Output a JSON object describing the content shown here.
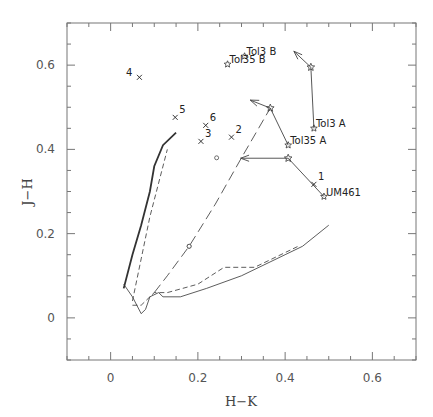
{
  "chart_data": {
    "type": "scatter",
    "title": "",
    "xlabel": "H−K",
    "ylabel": "J−H",
    "xlim": [
      -0.1,
      0.7
    ],
    "ylim": [
      -0.1,
      0.7
    ],
    "grid": false,
    "legend": null,
    "x_ticks": [
      0,
      0.2,
      0.4,
      0.6
    ],
    "x_tick_labels": [
      "0",
      "0.2",
      "0.4",
      "0.6"
    ],
    "y_ticks": [
      0,
      0.2,
      0.4,
      0.6
    ],
    "y_tick_labels": [
      "0",
      "0.2",
      "0.4",
      "0.6"
    ],
    "cross_points": [
      {
        "label": "1",
        "x": 0.466,
        "y": 0.317
      },
      {
        "label": "2",
        "x": 0.277,
        "y": 0.429
      },
      {
        "label": "3",
        "x": 0.207,
        "y": 0.419
      },
      {
        "label": "4",
        "x": 0.066,
        "y": 0.571
      },
      {
        "label": "5",
        "x": 0.148,
        "y": 0.476
      },
      {
        "label": "6",
        "x": 0.218,
        "y": 0.457
      }
    ],
    "galaxy_points": [
      {
        "label": "UM461",
        "x": 0.489,
        "y": 0.288
      },
      {
        "label": "Tol35 A",
        "x": 0.407,
        "y": 0.41
      },
      {
        "label": "Tol3 A",
        "x": 0.466,
        "y": 0.45
      },
      {
        "label": "Tol3 B",
        "x": 0.307,
        "y": 0.621
      },
      {
        "label": "Tol35 B",
        "x": 0.268,
        "y": 0.602
      }
    ],
    "correction_vectors": [
      {
        "from": [
          0.489,
          0.288
        ],
        "star": [
          0.407,
          0.379
        ],
        "arrow_to": [
          0.298,
          0.379
        ]
      },
      {
        "from": [
          0.407,
          0.41
        ],
        "star": [
          0.366,
          0.498
        ],
        "arrow_to": [
          0.32,
          0.517
        ]
      },
      {
        "from": [
          0.466,
          0.45
        ],
        "star": [
          0.459,
          0.595
        ],
        "arrow_to": [
          0.42,
          0.633
        ]
      }
    ],
    "model_tracks": [
      {
        "name": "long-dash track with circles",
        "style": "long-dash",
        "x": [
          0.1,
          0.13,
          0.18,
          0.24,
          0.3,
          0.366
        ],
        "y": [
          0.06,
          0.1,
          0.17,
          0.27,
          0.38,
          0.498
        ],
        "markers": [
          [
            0.18,
            0.17
          ],
          [
            0.243,
            0.38
          ],
          [
            0.18,
            0.17
          ]
        ]
      },
      {
        "name": "solid evolutionary track",
        "style": "solid",
        "x": [
          0.03,
          0.05,
          0.07,
          0.08,
          0.09,
          0.11,
          0.12,
          0.16,
          0.22,
          0.3,
          0.4,
          0.44,
          0.5
        ],
        "y": [
          0.08,
          0.05,
          0.01,
          0.02,
          0.05,
          0.06,
          0.05,
          0.05,
          0.07,
          0.1,
          0.15,
          0.17,
          0.22
        ]
      },
      {
        "name": "short-dash evolutionary track",
        "style": "short-dash",
        "x": [
          0.05,
          0.07,
          0.1,
          0.13,
          0.2,
          0.26,
          0.33,
          0.43
        ],
        "y": [
          0.03,
          0.03,
          0.06,
          0.06,
          0.08,
          0.12,
          0.12,
          0.17
        ]
      },
      {
        "name": "steep solid track",
        "style": "solid-thick",
        "x": [
          0.03,
          0.05,
          0.07,
          0.09,
          0.1,
          0.12,
          0.15
        ],
        "y": [
          0.07,
          0.15,
          0.22,
          0.3,
          0.36,
          0.41,
          0.44
        ]
      },
      {
        "name": "steep dashed track",
        "style": "short-dash",
        "x": [
          0.05,
          0.07,
          0.09,
          0.11,
          0.13
        ],
        "y": [
          0.04,
          0.14,
          0.24,
          0.32,
          0.4
        ]
      }
    ]
  }
}
